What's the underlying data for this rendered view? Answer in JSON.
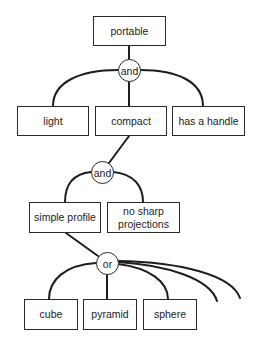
{
  "diagram": {
    "type": "and-or goal tree",
    "root": {
      "label": "portable"
    },
    "gates": [
      {
        "id": "g1",
        "label": "and"
      },
      {
        "id": "g2",
        "label": "and"
      },
      {
        "id": "g3",
        "label": "or"
      }
    ],
    "level1": [
      {
        "label": "light"
      },
      {
        "label": "compact"
      },
      {
        "label": "has a handle"
      }
    ],
    "level2": [
      {
        "label": "simple profile"
      },
      {
        "label": "no sharp\nprojections"
      }
    ],
    "level3": [
      {
        "label": "cube"
      },
      {
        "label": "pyramid"
      },
      {
        "label": "sphere"
      }
    ],
    "edges": [
      {
        "from": "portable",
        "to": "g1"
      },
      {
        "from": "g1",
        "to": "light"
      },
      {
        "from": "g1",
        "to": "compact"
      },
      {
        "from": "g1",
        "to": "has a handle"
      },
      {
        "from": "compact",
        "to": "g2"
      },
      {
        "from": "g2",
        "to": "simple profile"
      },
      {
        "from": "g2",
        "to": "no sharp projections"
      },
      {
        "from": "simple profile",
        "to": "g3"
      },
      {
        "from": "g3",
        "to": "cube"
      },
      {
        "from": "g3",
        "to": "pyramid"
      },
      {
        "from": "g3",
        "to": "sphere"
      },
      {
        "from": "g3",
        "to": "(unlabeled alternative 1)"
      },
      {
        "from": "g3",
        "to": "(unlabeled alternative 2)"
      }
    ]
  }
}
